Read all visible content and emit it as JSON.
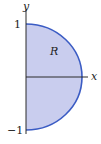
{
  "diagram": {
    "region_label": "R",
    "x_axis_label": "x",
    "y_axis_label": "y",
    "tick_top": "1",
    "tick_bottom": "−1",
    "colors": {
      "fill": "#c9cdee",
      "boundary": "#3b5cc4",
      "axis": "#2a2a2a"
    }
  }
}
